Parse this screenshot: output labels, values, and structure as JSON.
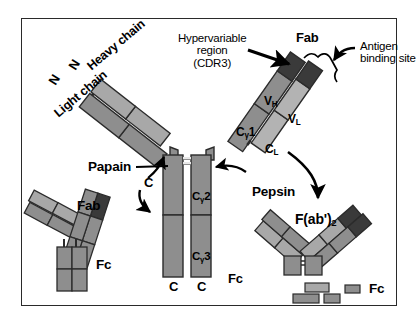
{
  "figure": {
    "background": "#ffffff",
    "border_color": "#2a2a2a"
  },
  "colors": {
    "outline": "#2b2b2b",
    "domain_mid": "#8e8e8e",
    "domain_light": "#b3b3b3",
    "domain_dark": "#3a3a3a",
    "text": "#000000"
  },
  "labels": {
    "hypervariable": "Hypervariable",
    "region": "region",
    "cdr3": "(CDR3)",
    "fab_top": "Fab",
    "antigen": "Antigen",
    "binding_site": "binding site",
    "heavy_chain": "Heavy chain",
    "light_chain": "Light chain",
    "n_term_1": "N",
    "n_term_2": "N",
    "papain": "Papain",
    "pepsin": "Pepsin",
    "c_hinge": "C",
    "c_bottom_left": "C",
    "c_bottom_right": "C",
    "fc_stem": "Fc",
    "fab_left": "Fab",
    "fc_left": "Fc",
    "fab2": "F(ab')",
    "fab2_sub": "2",
    "fc_right": "Fc",
    "vh": "V",
    "vh_sub": "H",
    "vl": "V",
    "vl_sub": "L",
    "cg1": "C",
    "cg1_sub": "γ",
    "cg1_num": "1",
    "cl": "C",
    "cl_sub": "L",
    "cg2": "C",
    "cg2_sub": "γ",
    "cg2_num": "2",
    "cg3": "C",
    "cg3_sub": "γ",
    "cg3_num": "3"
  }
}
